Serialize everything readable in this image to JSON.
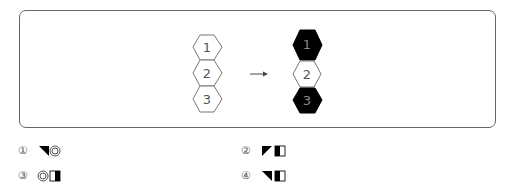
{
  "figure": {
    "before": {
      "hexagons": [
        {
          "label": "1",
          "fill": "white"
        },
        {
          "label": "2",
          "fill": "white"
        },
        {
          "label": "3",
          "fill": "white"
        }
      ]
    },
    "arrow": "→",
    "after": {
      "hexagons": [
        {
          "label": "1",
          "fill": "black"
        },
        {
          "label": "2",
          "fill": "white"
        },
        {
          "label": "3",
          "fill": "black"
        }
      ]
    }
  },
  "options": [
    {
      "num": "①",
      "symbols": [
        "black-triangle-top-right",
        "double-circle"
      ]
    },
    {
      "num": "②",
      "symbols": [
        "black-triangle-top-left",
        "half-filled-square-left"
      ]
    },
    {
      "num": "③",
      "symbols": [
        "double-circle",
        "half-filled-square-right"
      ]
    },
    {
      "num": "④",
      "symbols": [
        "black-triangle-top-right",
        "half-filled-square-left"
      ]
    }
  ]
}
